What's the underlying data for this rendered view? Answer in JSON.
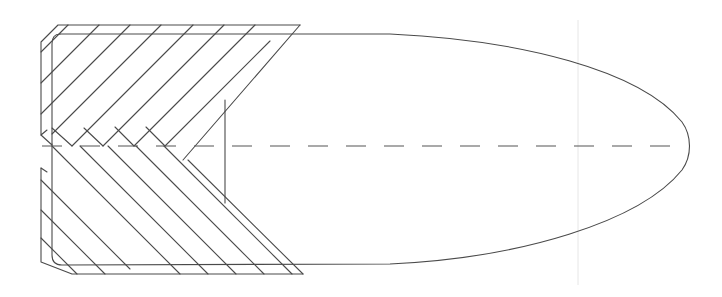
{
  "diagram": {
    "title": "",
    "colors": {
      "background": "#ffffff",
      "line": "#4a4a4a",
      "centerline": "#555555",
      "guide": "#e6e6e6"
    },
    "body": {
      "description": "ogive / ellipsoidal nose outline",
      "top_y": 34,
      "bottom_y": 265,
      "tip_x": 688,
      "tip_y": 146
    },
    "centerline": {
      "style": "dashed",
      "y": 146,
      "x_start": 42,
      "x_end": 680,
      "dash": 20,
      "gap": 18
    },
    "core_edge": {
      "x": 225,
      "y_top": 100,
      "y_bottom": 203
    },
    "jacket": {
      "hatching": "diagonal chevron",
      "upper_band": {
        "top_y": 25,
        "x_left": 40,
        "x_right": 300
      },
      "lower_band": {
        "bottom_y": 274,
        "x_left": 40,
        "x_right": 303
      },
      "notch_y": [
        135,
        168
      ]
    },
    "labels": []
  }
}
